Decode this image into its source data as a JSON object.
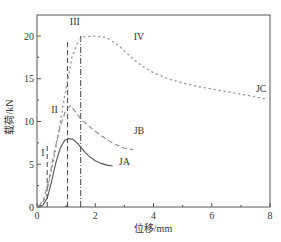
{
  "chart_data": {
    "type": "line",
    "title": "",
    "xlabel": "位移/mm",
    "ylabel": "载荷/kN",
    "xlim": [
      0,
      8
    ],
    "ylim": [
      0,
      22.5
    ],
    "xticks": [
      0,
      2,
      4,
      6,
      8
    ],
    "xticks_minor": [
      1,
      3,
      5,
      7
    ],
    "yticks": [
      0,
      5,
      10,
      15,
      20
    ],
    "grid": false,
    "legend": "inline labels",
    "series": [
      {
        "name": "JA",
        "style": "solid",
        "x": [
          0.0,
          0.2,
          0.35,
          0.5,
          0.65,
          0.8,
          0.95,
          1.1,
          1.25,
          1.4,
          1.6,
          1.8,
          2.0,
          2.2,
          2.4,
          2.6
        ],
        "y": [
          0.0,
          0.2,
          1.0,
          3.0,
          5.2,
          6.9,
          7.8,
          8.0,
          7.9,
          7.4,
          6.6,
          5.9,
          5.4,
          5.1,
          4.9,
          4.8
        ]
      },
      {
        "name": "JB",
        "style": "dashed",
        "x": [
          0.0,
          0.2,
          0.4,
          0.6,
          0.8,
          1.0,
          1.15,
          1.3,
          1.5,
          1.8,
          2.1,
          2.4,
          2.7,
          3.0,
          3.3
        ],
        "y": [
          0.0,
          0.5,
          3.0,
          6.5,
          9.5,
          11.4,
          11.8,
          11.2,
          10.3,
          9.4,
          8.6,
          7.9,
          7.3,
          6.9,
          6.7
        ]
      },
      {
        "name": "JC",
        "style": "dotted",
        "x": [
          0.0,
          0.3,
          0.6,
          0.9,
          1.2,
          1.4,
          1.6,
          2.0,
          2.4,
          2.8,
          3.2,
          3.6,
          4.0,
          4.5,
          5.0,
          5.5,
          6.0,
          6.5,
          7.0,
          7.5,
          7.9
        ],
        "y": [
          0.0,
          1.0,
          6.0,
          12.0,
          17.5,
          19.3,
          19.9,
          20.0,
          19.8,
          18.9,
          17.6,
          16.5,
          15.7,
          15.0,
          14.5,
          14.1,
          13.8,
          13.5,
          13.2,
          12.9,
          12.6
        ]
      }
    ],
    "stage_lines": [
      {
        "label": "I",
        "x": 0.35,
        "y_top": 7.5,
        "style": "dashed"
      },
      {
        "label": "II",
        "x": 1.05,
        "y_top": 19.5,
        "style": "dashed"
      },
      {
        "label": "III",
        "x": 1.5,
        "y_top": 20.0,
        "style": "dashdot"
      }
    ],
    "annotations": [
      {
        "text": "I",
        "x": 0.2,
        "y": 6.0
      },
      {
        "text": "II",
        "x": 0.6,
        "y": 11.0
      },
      {
        "text": "III",
        "x": 1.3,
        "y": 21.3
      },
      {
        "text": "IV",
        "x": 3.5,
        "y": 19.5
      },
      {
        "text": "JA",
        "x": 3.0,
        "y": 4.9
      },
      {
        "text": "JB",
        "x": 3.5,
        "y": 8.5
      },
      {
        "text": "JC",
        "x": 7.7,
        "y": 13.5
      }
    ]
  }
}
